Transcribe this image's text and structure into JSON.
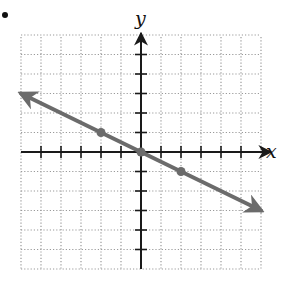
{
  "item_marker": "•",
  "chart_data": {
    "type": "line",
    "title": "",
    "xlabel": "x",
    "ylabel": "y",
    "xlim": [
      -6,
      6
    ],
    "ylim": [
      -6,
      6
    ],
    "grid": true,
    "grid_style": "dotted",
    "tick_step": 1,
    "tick_labels": false,
    "series": [
      {
        "name": "line",
        "equation": "y = -x/2",
        "slope": -0.5,
        "intercept": 0,
        "x_range": [
          -6,
          6
        ],
        "arrows_both_ends": true,
        "color": "#6b6b6b",
        "marked_points": [
          {
            "x": -2,
            "y": 1
          },
          {
            "x": 0,
            "y": 0
          },
          {
            "x": 2,
            "y": -1
          }
        ]
      }
    ]
  },
  "colors": {
    "axis": "#1a1a1a",
    "grid": "#9a9a9a",
    "line": "#6b6b6b",
    "point": "#6b6b6b"
  }
}
